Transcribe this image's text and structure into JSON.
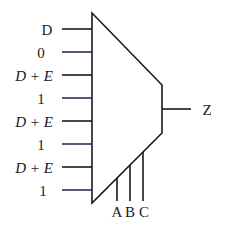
{
  "diagram": {
    "type": "multiplexer",
    "inputs": [
      {
        "label": "D",
        "italic": false
      },
      {
        "label": "0",
        "italic": false
      },
      {
        "label": "D + E",
        "italic": true
      },
      {
        "label": "1",
        "italic": false
      },
      {
        "label": "D + E",
        "italic": true
      },
      {
        "label": "1",
        "italic": false
      },
      {
        "label": "D + E",
        "italic": true
      },
      {
        "label": "1",
        "italic": false
      }
    ],
    "output": {
      "label": "Z"
    },
    "selects": [
      {
        "label": "A"
      },
      {
        "label": "B"
      },
      {
        "label": "C"
      }
    ]
  }
}
